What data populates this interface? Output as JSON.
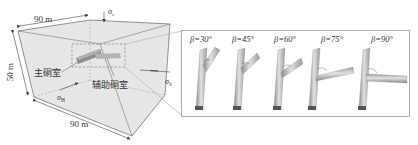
{
  "model_box": {
    "width_label_top": "90 m",
    "width_label_bottom": "90 m",
    "height_label": "50 m",
    "stress_vertical": "σ",
    "stress_vertical_sub": "v",
    "stress_H": "σ",
    "stress_H_sub": "H",
    "stress_h": "σ",
    "stress_h_sub": "h",
    "main_chamber_label": "主硐室",
    "aux_chamber_label": "辅助硐室"
  },
  "angle_panel": {
    "items": [
      {
        "label": "β=30°",
        "beta": 30
      },
      {
        "label": "β=45°",
        "beta": 45
      },
      {
        "label": "β=60°",
        "beta": 60
      },
      {
        "label": "β=75°",
        "beta": 75
      },
      {
        "label": "β=90°",
        "beta": 90
      }
    ]
  },
  "colors": {
    "box_fill": "#e6e6e6",
    "line": "#555555",
    "tunnel_light": "#d4d4d4",
    "tunnel_dark": "#6e6e6e",
    "panel_border": "#9a9a9a"
  }
}
